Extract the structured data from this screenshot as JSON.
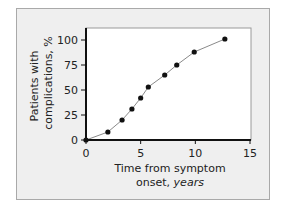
{
  "chart_data": {
    "type": "line",
    "title": "",
    "xlabel": "Time from symptom",
    "xlabel_line2_prefix": "onset, ",
    "xlabel_line2_italic": "years",
    "ylabel_line1": "Patients with",
    "ylabel_line2": "complications, %",
    "xlim": [
      0,
      15
    ],
    "ylim": [
      0,
      110
    ],
    "xticks": [
      0,
      5,
      10,
      15
    ],
    "xtick_labels": [
      "0",
      "5",
      "10",
      "15"
    ],
    "yticks": [
      0,
      25,
      50,
      75,
      100
    ],
    "ytick_labels": [
      "0",
      "25",
      "50",
      "75",
      "100"
    ],
    "grid": false,
    "legend": "none",
    "series": [
      {
        "name": "Patients with complications",
        "x": [
          0,
          2.0,
          3.3,
          4.2,
          5.0,
          5.7,
          7.2,
          8.3,
          9.9,
          12.7
        ],
        "y": [
          0,
          8,
          20,
          31,
          42,
          53,
          65,
          75,
          88,
          101
        ]
      }
    ],
    "colors": {
      "line": "#8a8a8a",
      "marker": "#111111",
      "axis": "#111111",
      "plot_background": "#ffffff",
      "frame_background": "#efefef"
    }
  }
}
